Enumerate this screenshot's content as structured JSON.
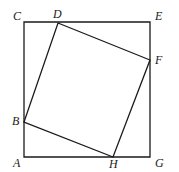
{
  "figure": {
    "stroke_color": "#1a1a1a",
    "background_color": "#ffffff",
    "stroke_width": 1.3,
    "canvas": {
      "width": 179,
      "height": 172
    }
  },
  "outer_square": {
    "name": "ACEG",
    "corners": [
      {
        "label": "C",
        "x": 24,
        "y": 22,
        "label_x": 13,
        "label_y": 10
      },
      {
        "label": "E",
        "x": 150,
        "y": 22,
        "label_x": 155,
        "label_y": 10
      },
      {
        "label": "G",
        "x": 150,
        "y": 157,
        "label_x": 155,
        "label_y": 157
      },
      {
        "label": "A",
        "x": 24,
        "y": 157,
        "label_x": 13,
        "label_y": 157
      }
    ]
  },
  "inner_square": {
    "name": "BDFH",
    "vertices": [
      {
        "label": "D",
        "x": 58,
        "y": 23,
        "on_edge": "top",
        "label_x": 53,
        "label_y": 8
      },
      {
        "label": "F",
        "x": 150,
        "y": 60,
        "on_edge": "right",
        "label_x": 155,
        "label_y": 54
      },
      {
        "label": "H",
        "x": 113,
        "y": 157,
        "on_edge": "bottom",
        "label_x": 109,
        "label_y": 158
      },
      {
        "label": "B",
        "x": 24,
        "y": 122,
        "on_edge": "left",
        "label_x": 12,
        "label_y": 115
      }
    ]
  },
  "labels": {
    "A": "A",
    "B": "B",
    "C": "C",
    "D": "D",
    "E": "E",
    "F": "F",
    "G": "G",
    "H": "H"
  }
}
